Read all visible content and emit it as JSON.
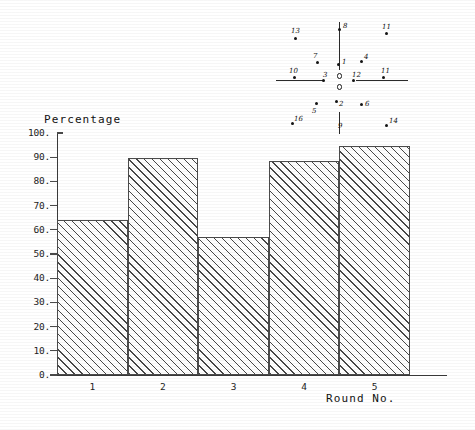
{
  "chart_data": {
    "type": "bar",
    "title": "",
    "categories": [
      "1",
      "2",
      "3",
      "4",
      "5"
    ],
    "values": [
      64,
      89.5,
      57,
      88.5,
      94.5
    ],
    "xlabel": "Round No.",
    "ylabel": "Percentage",
    "ylim": [
      0,
      100
    ],
    "ytick_labels": [
      "100.",
      "90.",
      "80.",
      "70.",
      "60.",
      "50.",
      "40.",
      "30.",
      "20.",
      "10.",
      "0."
    ],
    "ytick_values": [
      100,
      90,
      80,
      70,
      60,
      50,
      40,
      30,
      20,
      10,
      0
    ],
    "grid": false,
    "legend": null,
    "bar_style": "diagonal-hatch"
  },
  "axes": {
    "y_title": "Percentage",
    "x_title": "Round No."
  },
  "artifact": {
    "name": "scan-registration-mark",
    "labels": [
      "13",
      "8",
      "11",
      "7",
      "1",
      "4",
      "10",
      "3",
      "0",
      "12",
      "2",
      "6",
      "5",
      "16",
      "9",
      "14"
    ]
  }
}
